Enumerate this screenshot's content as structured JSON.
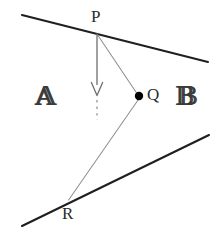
{
  "figure": {
    "background_color": "#ffffff",
    "width": 218,
    "height": 232,
    "colors": {
      "boundary_line": "#1f1f1f",
      "ray_line": "#8a8a8a",
      "normal_line": "#6e6e6e",
      "point_marker": "#000000",
      "label_text": "#2b2b2b",
      "region_text": "#3a3a3a"
    },
    "labels": {
      "point_p": "P",
      "point_q": "Q",
      "point_r": "R",
      "region_a": "𝔸",
      "region_b": "𝔹"
    },
    "geometry": {
      "upper_boundary": {
        "x1": 22,
        "y1": 15,
        "x2": 208,
        "y2": 62,
        "stroke_width": 2.1
      },
      "lower_boundary": {
        "x1": 22,
        "y1": 226,
        "x2": 209,
        "y2": 135,
        "stroke_width": 2.1
      },
      "ray_pq": {
        "x1": 97,
        "y1": 34,
        "x2": 138,
        "y2": 95,
        "stroke_width": 1.0
      },
      "ray_qr": {
        "x1": 139,
        "y1": 99,
        "x2": 69,
        "y2": 200,
        "stroke_width": 1.0
      },
      "normal_solid": {
        "x1": 97,
        "y1": 34,
        "x2": 97,
        "y2": 94,
        "stroke_width": 1.3
      },
      "normal_dashed": {
        "x1": 97,
        "y1": 99,
        "x2": 97,
        "y2": 120,
        "stroke_width": 1.3,
        "dash": "2.5 4"
      },
      "arrow_head": {
        "tip_x": 97,
        "tip_y": 95,
        "half_width": 5.5,
        "height": 13
      },
      "point_p": {
        "cx": 97,
        "cy": 34
      },
      "point_q": {
        "cx": 139,
        "cy": 96,
        "r": 4.2
      },
      "point_r": {
        "cx": 68,
        "cy": 200
      }
    }
  }
}
